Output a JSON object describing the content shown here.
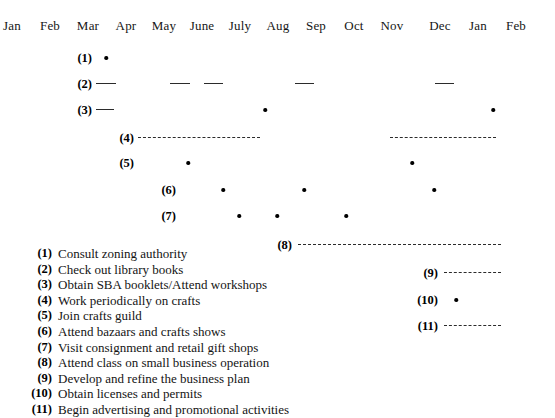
{
  "chart_data": {
    "type": "table",
    "title": "",
    "xlabel": "",
    "ylabel": "",
    "grid": false,
    "legend_position": "bottom-left",
    "axis": {
      "name": "month-axis",
      "ticks": [
        "Jan",
        "Feb",
        "Mar",
        "Apr",
        "May",
        "June",
        "July",
        "Aug",
        "Sep",
        "Oct",
        "Nov",
        "Dec",
        "Jan",
        "Feb"
      ],
      "tick_x": [
        12,
        50,
        88,
        126,
        164,
        202,
        240,
        278,
        316,
        354,
        392,
        440,
        478,
        516
      ]
    },
    "rows": [
      {
        "id": "1",
        "tag": "(1)",
        "tag_x": 92,
        "y": 50,
        "markers": [
          {
            "kind": "dot",
            "x": 106
          }
        ]
      },
      {
        "id": "2",
        "tag": "(2)",
        "tag_x": 92,
        "y": 76,
        "markers": [
          {
            "kind": "dash",
            "x": 96,
            "w": 20
          },
          {
            "kind": "dash",
            "x": 170,
            "w": 20
          },
          {
            "kind": "dash",
            "x": 204,
            "w": 19
          },
          {
            "kind": "dash",
            "x": 295,
            "w": 19
          },
          {
            "kind": "dash",
            "x": 435,
            "w": 19
          }
        ]
      },
      {
        "id": "3",
        "tag": "(3)",
        "tag_x": 92,
        "y": 102,
        "markers": [
          {
            "kind": "dash",
            "x": 96,
            "w": 18
          },
          {
            "kind": "dot",
            "x": 265
          },
          {
            "kind": "dot",
            "x": 493
          }
        ]
      },
      {
        "id": "4",
        "tag": "(4)",
        "tag_x": 134,
        "y": 130,
        "markers": [
          {
            "kind": "spaced",
            "x": 138,
            "w": 122
          },
          {
            "kind": "spaced",
            "x": 390,
            "w": 106
          }
        ]
      },
      {
        "id": "5",
        "tag": "(5)",
        "tag_x": 134,
        "y": 155,
        "markers": [
          {
            "kind": "dot",
            "x": 188
          },
          {
            "kind": "dot",
            "x": 412
          }
        ]
      },
      {
        "id": "6",
        "tag": "(6)",
        "tag_x": 176,
        "y": 182,
        "markers": [
          {
            "kind": "dot",
            "x": 223
          },
          {
            "kind": "dot",
            "x": 304
          },
          {
            "kind": "dot",
            "x": 434
          }
        ]
      },
      {
        "id": "7",
        "tag": "(7)",
        "tag_x": 176,
        "y": 208,
        "markers": [
          {
            "kind": "dot",
            "x": 239
          },
          {
            "kind": "dot",
            "x": 277
          },
          {
            "kind": "dot",
            "x": 346
          }
        ]
      },
      {
        "id": "8",
        "tag": "(8)",
        "tag_x": 292,
        "y": 237,
        "markers": [
          {
            "kind": "dashline",
            "x": 298,
            "w": 203
          }
        ]
      },
      {
        "id": "9",
        "tag": "(9)",
        "tag_x": 438,
        "y": 265,
        "markers": [
          {
            "kind": "dashline",
            "x": 444,
            "w": 57
          }
        ]
      },
      {
        "id": "10",
        "tag": "(10)",
        "tag_x": 438,
        "y": 292,
        "markers": [
          {
            "kind": "dot",
            "x": 456
          }
        ]
      },
      {
        "id": "11",
        "tag": "(11)",
        "tag_x": 438,
        "y": 318,
        "markers": [
          {
            "kind": "dashline",
            "x": 444,
            "w": 57
          }
        ]
      }
    ],
    "legend": [
      {
        "num": "(1)",
        "text": "Consult zoning authority"
      },
      {
        "num": "(2)",
        "text": "Check out library books"
      },
      {
        "num": "(3)",
        "text": "Obtain SBA booklets/Attend workshops"
      },
      {
        "num": "(4)",
        "text": "Work periodically on crafts"
      },
      {
        "num": "(5)",
        "text": "Join crafts guild"
      },
      {
        "num": "(6)",
        "text": "Attend bazaars and crafts shows"
      },
      {
        "num": "(7)",
        "text": "Visit consignment and retail gift shops"
      },
      {
        "num": "(8)",
        "text": "Attend class on small business operation"
      },
      {
        "num": "(9)",
        "text": "Develop and refine the business plan"
      },
      {
        "num": "(10)",
        "text": "Obtain licenses and permits"
      },
      {
        "num": "(11)",
        "text": "Begin advertising and promotional activities"
      }
    ],
    "colors": {
      "marker": "#000000",
      "line": "#2b2b2b",
      "text": "#141414",
      "background": "#ffffff"
    }
  }
}
